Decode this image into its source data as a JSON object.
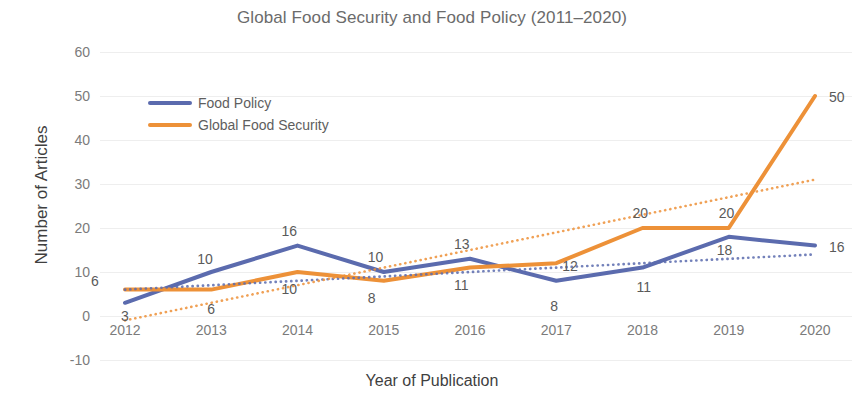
{
  "chart_data": {
    "type": "line",
    "title": "Global Food Security and Food Policy (2011–2020)",
    "xlabel": "Year of Publication",
    "ylabel": "Number of Articles",
    "categories": [
      "2012",
      "2013",
      "2014",
      "2015",
      "2016",
      "2017",
      "2018",
      "2019",
      "2020"
    ],
    "ylim": [
      -10,
      60
    ],
    "yticks": [
      "60",
      "50",
      "40",
      "30",
      "20",
      "10",
      "0",
      "-10"
    ],
    "ytick_values": [
      60,
      50,
      40,
      30,
      20,
      10,
      0,
      -10
    ],
    "grid": true,
    "legend_position": "upper-left-inside",
    "series": [
      {
        "name": "Food Policy",
        "color": "#5B6BAE",
        "style": "solid",
        "values": [
          3,
          10,
          16,
          10,
          13,
          8,
          11,
          18,
          16
        ],
        "labels": [
          "3",
          "10",
          "16",
          "10",
          "13",
          "8",
          "11",
          "18",
          "16"
        ]
      },
      {
        "name": "Global Food Security",
        "color": "#ED9138",
        "style": "solid",
        "values": [
          6,
          6,
          10,
          8,
          11,
          12,
          20,
          20,
          50
        ],
        "labels": [
          "6",
          "6",
          "10",
          "8",
          "11",
          "12",
          "20",
          "20",
          "50"
        ]
      },
      {
        "name": "Food Policy trendline",
        "color": "#5B6BAE",
        "style": "dotted",
        "values": [
          6,
          7,
          8,
          9,
          10,
          11,
          12,
          13,
          14
        ],
        "labels": []
      },
      {
        "name": "Global Food Security trendline",
        "color": "#ED9138",
        "style": "dotted",
        "values": [
          -1,
          3,
          7,
          11,
          15,
          19,
          23,
          27,
          31
        ],
        "labels": []
      }
    ]
  },
  "legend": {
    "items": [
      {
        "label": "Food Policy",
        "color": "#5B6BAE"
      },
      {
        "label": "Global Food Security",
        "color": "#ED9138"
      }
    ]
  }
}
